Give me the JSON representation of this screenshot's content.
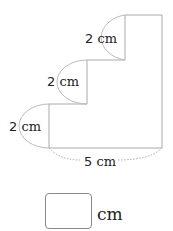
{
  "figure": {
    "shape": "staircase-polygon",
    "stroke_color": "#aaaaaa",
    "labels": {
      "top_step": {
        "value": "2",
        "unit": "cm"
      },
      "middle_step": {
        "value": "2",
        "unit": "cm"
      },
      "bottom_step": {
        "value": "2",
        "unit": "cm"
      },
      "base": {
        "value": "5",
        "unit": "cm"
      }
    }
  },
  "answer": {
    "value": "",
    "unit": "cm"
  }
}
